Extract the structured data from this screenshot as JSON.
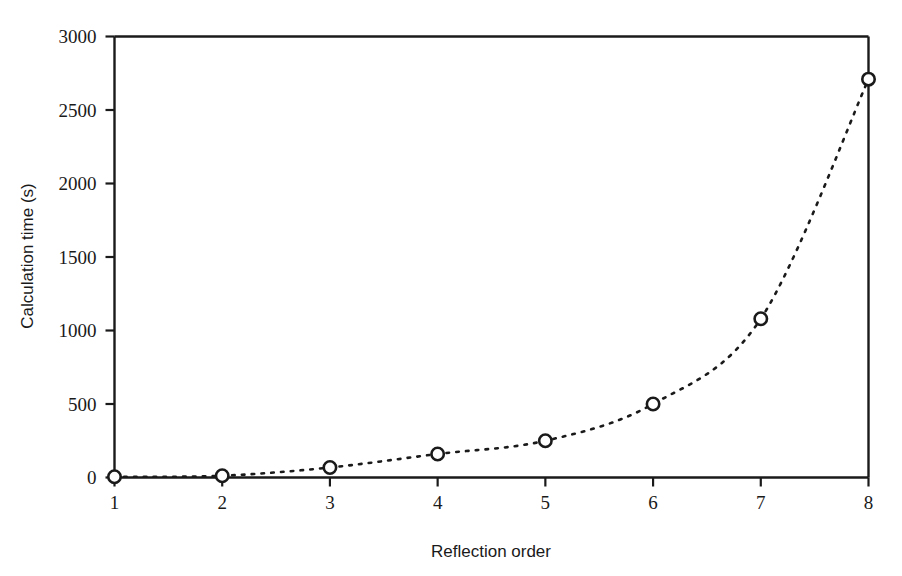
{
  "figure": {
    "background_color": "#ffffff",
    "ink_color": "#1a1a1a"
  },
  "chart_data": {
    "type": "line",
    "title": "",
    "xlabel": "Reflection order",
    "ylabel": "Calculation time (s)",
    "x": [
      1,
      2,
      3,
      4,
      5,
      6,
      7,
      8
    ],
    "values": [
      5,
      12,
      68,
      160,
      250,
      500,
      1080,
      2710
    ],
    "series": [
      {
        "name": "Calculation time",
        "values": [
          5,
          12,
          68,
          160,
          250,
          500,
          1080,
          2710
        ],
        "line_style": "dotted",
        "marker": "open-circle",
        "color": "#1a1a1a"
      }
    ],
    "xlim": [
      1,
      8
    ],
    "ylim": [
      0,
      3000
    ],
    "xticks": [
      1,
      2,
      3,
      4,
      5,
      6,
      7,
      8
    ],
    "xticklabels": [
      "1",
      "2",
      "3",
      "4",
      "5",
      "6",
      "7",
      "8"
    ],
    "yticks": [
      0,
      500,
      1000,
      1500,
      2000,
      2500,
      3000
    ],
    "yticklabels": [
      "0",
      "500",
      "1000",
      "1500",
      "2000",
      "2500",
      "3000"
    ],
    "grid": false,
    "legend": null,
    "annotations": []
  }
}
